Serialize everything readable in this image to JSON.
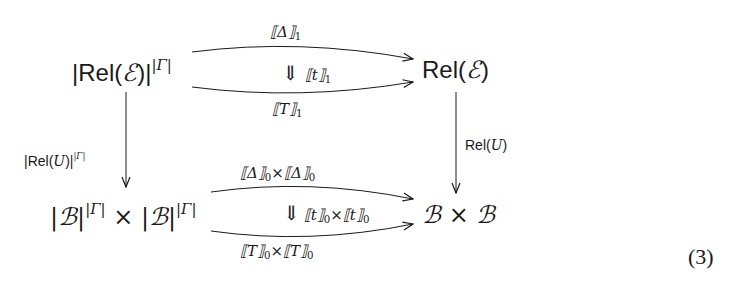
{
  "diagram": {
    "type": "commutative-diagram",
    "nodes": {
      "top_left": {
        "prefix": "|Rel(",
        "symbol": "ℰ",
        "suffix": ")|",
        "superscript": "|Γ|"
      },
      "top_right": {
        "prefix": "Rel(",
        "symbol": "ℰ",
        "suffix": ")"
      },
      "bottom_left": {
        "part1": "|ℬ|",
        "sup1": "|Γ|",
        "times": "×",
        "part2": "|ℬ|",
        "sup2": "|Γ|"
      },
      "bottom_right": {
        "text": "ℬ × ℬ"
      }
    },
    "top_arrows": {
      "upper_label": {
        "text": "⟦Δ⟧",
        "sub": "1"
      },
      "two_cell_arrow": "⇓",
      "two_cell_label": {
        "text": "⟦t⟧",
        "sub": "1"
      },
      "lower_label": {
        "text": "⟦T⟧",
        "sub": "1"
      }
    },
    "bottom_arrows": {
      "upper_label": {
        "a": "⟦Δ⟧",
        "a_sub": "0",
        "times": "×",
        "b": "⟦Δ⟧",
        "b_sub": "0"
      },
      "two_cell_arrow": "⇓",
      "two_cell_label": {
        "a": "⟦t⟧",
        "a_sub": "0",
        "times": "×",
        "b": "⟦t⟧",
        "b_sub": "0"
      },
      "lower_label": {
        "a": "⟦T⟧",
        "a_sub": "0",
        "times": "×",
        "b": "⟦T⟧",
        "b_sub": "0"
      }
    },
    "left_arrow": {
      "prefix": "|Rel(",
      "symbol": "U",
      "suffix": ")|",
      "superscript": "|Γ|"
    },
    "right_arrow": {
      "prefix": "Rel(",
      "symbol": "U",
      "suffix": ")"
    },
    "equation_number": "(3)",
    "colors": {
      "ink": "#1a1a1a",
      "background": "#ffffff"
    }
  }
}
